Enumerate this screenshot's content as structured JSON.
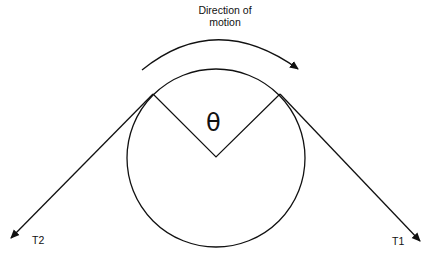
{
  "diagram": {
    "type": "belt-friction",
    "labels": {
      "motion_line1": "Direction of",
      "motion_line2": "motion",
      "angle": "θ",
      "tension_left": "T2",
      "tension_right": "T1"
    },
    "colors": {
      "stroke": "#111111",
      "background": "#ffffff"
    }
  }
}
